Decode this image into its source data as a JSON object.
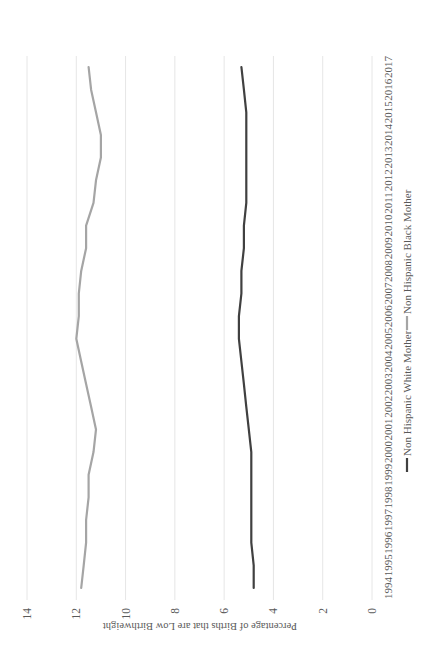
{
  "chart_data": {
    "type": "line",
    "title": "",
    "xlabel": "",
    "ylabel": "Percentage of Births that are Low Birthweight",
    "ylim": [
      0,
      14
    ],
    "yticks": [
      0,
      2,
      4,
      6,
      8,
      10,
      12,
      14
    ],
    "grid": true,
    "legend_position": "bottom",
    "x": [
      "1994",
      "1995",
      "1996",
      "1997",
      "1998",
      "1999",
      "2000",
      "2001",
      "2002",
      "2003",
      "2004",
      "2005",
      "2006",
      "2007",
      "2008",
      "2009",
      "2010",
      "2011",
      "2012",
      "2013",
      "2014",
      "2015",
      "2016",
      "2017"
    ],
    "series": [
      {
        "name": "Non Hispanic White Mother",
        "color": "#404040",
        "values": [
          4.8,
          4.8,
          4.9,
          4.9,
          4.9,
          4.9,
          4.9,
          5.0,
          5.1,
          5.2,
          5.3,
          5.4,
          5.4,
          5.3,
          5.3,
          5.2,
          5.2,
          5.1,
          5.1,
          5.1,
          5.1,
          5.1,
          5.2,
          5.3
        ]
      },
      {
        "name": "Non Hispanic Black Mother",
        "color": "#a5a5a5",
        "values": [
          11.8,
          11.7,
          11.6,
          11.6,
          11.5,
          11.5,
          11.3,
          11.2,
          11.4,
          11.6,
          11.8,
          12.0,
          11.9,
          11.9,
          11.8,
          11.6,
          11.6,
          11.3,
          11.2,
          11.0,
          11.0,
          11.2,
          11.4,
          11.5
        ]
      }
    ],
    "orientation_note": "rotated 90 degrees counter-clockwise on screen"
  },
  "legend": {
    "items": [
      {
        "label": "Non Hispanic White Mother",
        "color": "#404040"
      },
      {
        "label": "Non Hispanic Black Mother",
        "color": "#a5a5a5"
      }
    ]
  }
}
